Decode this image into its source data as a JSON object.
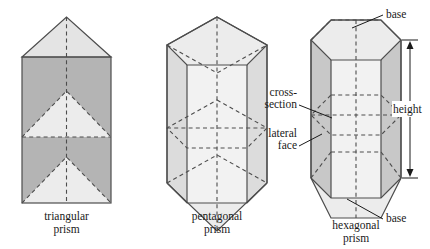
{
  "figure": {
    "background_color": "#ffffff",
    "stroke_color": "#4d4d4d",
    "text_color": "#1a1a1a",
    "fill_light": "#ececec",
    "fill_mid": "#dcdcdc",
    "fill_dark": "#b4b4b4"
  },
  "shapes": [
    {
      "id": "triangular-prism",
      "caption_line1": "triangular",
      "caption_line2": "prism",
      "sides": 3
    },
    {
      "id": "pentagonal-prism",
      "caption_line1": "pentagonal",
      "caption_line2": "prism",
      "sides": 5
    },
    {
      "id": "hexagonal-prism",
      "caption_line1": "hexagonal",
      "caption_line2": "prism",
      "sides": 6
    }
  ],
  "annotations": {
    "base_top": "base",
    "base_bottom": "base",
    "height": "height",
    "cross_section_line1": "cross-",
    "cross_section_line2": "section",
    "lateral_face_line1": "lateral",
    "lateral_face_line2": "face"
  }
}
